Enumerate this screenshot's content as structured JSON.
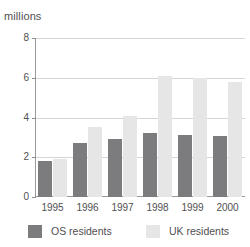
{
  "chart_data": {
    "type": "bar",
    "title": "",
    "subtitle": "",
    "unit_label": "millions",
    "xlabel": "",
    "ylabel": "millions",
    "categories": [
      "1995",
      "1996",
      "1997",
      "1998",
      "1999",
      "2000"
    ],
    "series": [
      {
        "name": "OS residents",
        "color": "#7c7c7e",
        "values": [
          1.8,
          2.7,
          2.9,
          3.2,
          3.1,
          3.05
        ]
      },
      {
        "name": "UK residents",
        "color": "#e6e6e6",
        "values": [
          1.9,
          3.5,
          4.1,
          6.1,
          6.0,
          5.8
        ]
      }
    ],
    "ylim": [
      0,
      8
    ],
    "yticks": [
      0,
      2,
      4,
      6,
      8
    ],
    "ytick_labels": [
      "0",
      "2",
      "4",
      "6",
      "8"
    ],
    "grid": true,
    "legend_position": "bottom"
  },
  "legend": {
    "entries": [
      {
        "label": "OS residents",
        "swatch": "dark"
      },
      {
        "label": "UK residents",
        "swatch": "light"
      }
    ]
  }
}
